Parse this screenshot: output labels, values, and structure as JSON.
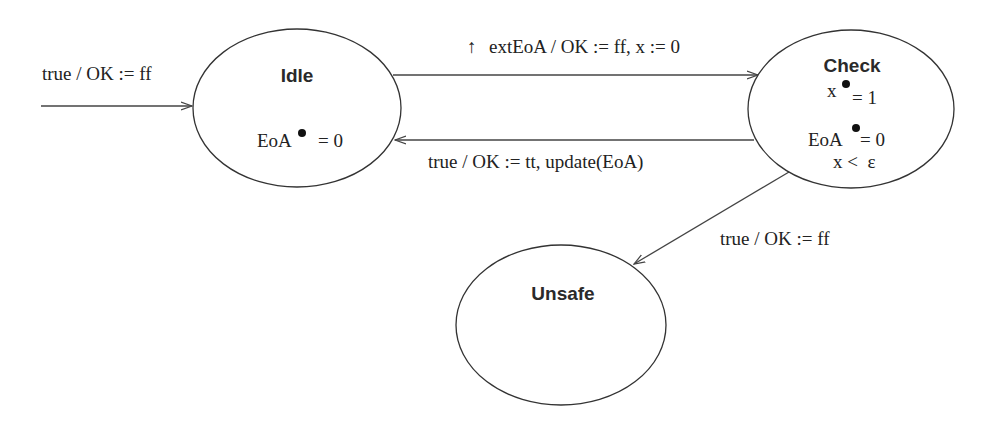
{
  "diagram": {
    "type": "state-machine",
    "states": [
      {
        "id": "idle",
        "title": "Idle",
        "invariants": [
          {
            "var": "EoA",
            "derivative_marker": "dot",
            "rhs": "= 0"
          }
        ],
        "initial": true
      },
      {
        "id": "check",
        "title": "Check",
        "invariants": [
          {
            "var": "x",
            "derivative_marker": "dot",
            "rhs": "= 1"
          },
          {
            "var": "EoA",
            "derivative_marker": "dot",
            "rhs": "= 0"
          }
        ],
        "condition": "x <  ε"
      },
      {
        "id": "unsafe",
        "title": "Unsafe",
        "invariants": []
      }
    ],
    "transitions": [
      {
        "id": "init",
        "from": null,
        "to": "idle",
        "label": "true / OK := ff"
      },
      {
        "id": "idle-to-check",
        "from": "idle",
        "to": "check",
        "event_marker": "↑",
        "label": "extEoA / OK := ff, x := 0"
      },
      {
        "id": "check-to-idle",
        "from": "check",
        "to": "idle",
        "label": "true / OK := tt, update(EoA)"
      },
      {
        "id": "check-to-unsafe",
        "from": "check",
        "to": "unsafe",
        "label": "true / OK := ff"
      }
    ],
    "colors": {
      "stroke": "#333333",
      "text": "#222222",
      "background": "#ffffff"
    }
  }
}
